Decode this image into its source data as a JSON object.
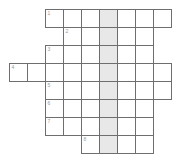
{
  "puzzle": {
    "title": "Crossword Grid",
    "cell_size": 18,
    "origin_x": 9,
    "origin_y": 9,
    "shaded_column_index": 5,
    "colors": {
      "cell_fill": "#ffffff",
      "cell_border": "#6e6e6e",
      "shaded_fill": "#e8e8e8",
      "number_text": "#9a9a9a",
      "background": "#ffffff"
    },
    "rows": [
      {
        "row_index": 0,
        "clue_number": "1",
        "start_col": 2,
        "length": 7,
        "cells": [
          "",
          "",
          "",
          "",
          "",
          "",
          ""
        ]
      },
      {
        "row_index": 1,
        "clue_number": "2",
        "start_col": 3,
        "length": 5,
        "cells": [
          "",
          "",
          "",
          "",
          ""
        ]
      },
      {
        "row_index": 2,
        "clue_number": "3",
        "start_col": 2,
        "length": 6,
        "cells": [
          "",
          "",
          "",
          "",
          "",
          ""
        ]
      },
      {
        "row_index": 3,
        "clue_number": "4",
        "start_col": 0,
        "length": 9,
        "cells": [
          "",
          "",
          "",
          "",
          "",
          "",
          "",
          "",
          ""
        ]
      },
      {
        "row_index": 4,
        "clue_number": "5",
        "start_col": 2,
        "length": 7,
        "cells": [
          "",
          "",
          "",
          "",
          "",
          "",
          ""
        ]
      },
      {
        "row_index": 5,
        "clue_number": "6",
        "start_col": 2,
        "length": 6,
        "cells": [
          "",
          "",
          "",
          "",
          "",
          ""
        ]
      },
      {
        "row_index": 6,
        "clue_number": "7",
        "start_col": 2,
        "length": 6,
        "cells": [
          "",
          "",
          "",
          "",
          "",
          ""
        ]
      },
      {
        "row_index": 7,
        "clue_number": "8",
        "start_col": 4,
        "length": 4,
        "cells": [
          "",
          "",
          "",
          ""
        ]
      }
    ]
  }
}
